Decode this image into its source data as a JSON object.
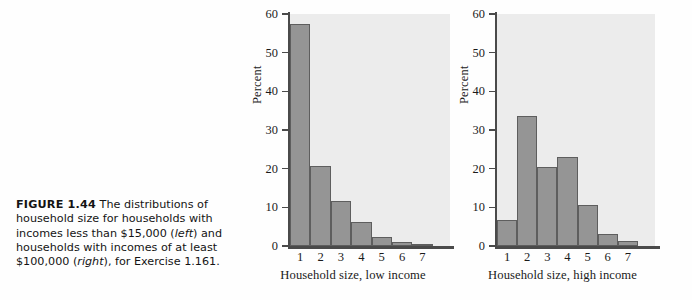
{
  "caption": {
    "figure_number": "FIGURE 1.44",
    "line1": "The distributions",
    "line2": "of household size for households",
    "line3": "with incomes less than $15,000",
    "left_word": "left",
    "line4_rest": ") and households with",
    "line5": "incomes of at least $100,000",
    "right_word": "right",
    "line6_rest": "), for Exercise 1.161."
  },
  "colors": {
    "bar_fill": "#959595",
    "bar_edge": "#5e5e5e",
    "plot_background": "#ececec",
    "axis": "#4a4a4a",
    "page_background": "#fefefe"
  },
  "chart_data": [
    {
      "type": "bar",
      "id": "low-income",
      "title": "",
      "xlabel": "Household size, low income",
      "ylabel": "Percent",
      "categories": [
        "1",
        "2",
        "3",
        "4",
        "5",
        "6",
        "7"
      ],
      "values": [
        57.5,
        20.8,
        11.6,
        6.1,
        2.4,
        1.1,
        0.4
      ],
      "ylim": [
        0,
        60
      ],
      "yticks": [
        0,
        10,
        20,
        30,
        40,
        50,
        60
      ],
      "grid": false,
      "legend": "none"
    },
    {
      "type": "bar",
      "id": "high-income",
      "title": "",
      "xlabel": "Household size, high income",
      "ylabel": "Percent",
      "categories": [
        "1",
        "2",
        "3",
        "4",
        "5",
        "6",
        "7"
      ],
      "values": [
        6.6,
        33.7,
        20.5,
        23.1,
        10.5,
        3.2,
        1.4
      ],
      "ylim": [
        0,
        60
      ],
      "yticks": [
        0,
        10,
        20,
        30,
        40,
        50,
        60
      ],
      "grid": false,
      "legend": "none"
    }
  ]
}
